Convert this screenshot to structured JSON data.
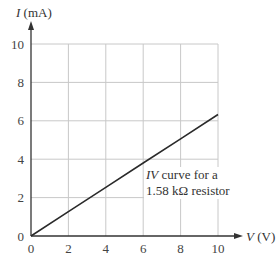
{
  "chart_data": {
    "type": "line",
    "title": "",
    "xlabel": "V (V)",
    "ylabel": "I (mA)",
    "xlabel_var": "V",
    "xlabel_unit": "(V)",
    "ylabel_var": "I",
    "ylabel_unit": "(mA)",
    "xlim": [
      0,
      10
    ],
    "ylim": [
      0,
      10
    ],
    "xticks": [
      0,
      2,
      4,
      6,
      8,
      10
    ],
    "yticks": [
      0,
      2,
      4,
      6,
      8,
      10
    ],
    "grid": true,
    "legend": null,
    "series": [
      {
        "name": "IV curve for a 1.58 kΩ resistor",
        "x": [
          0,
          2,
          4,
          6,
          8,
          10
        ],
        "y": [
          0,
          1.27,
          2.53,
          3.8,
          5.06,
          6.33
        ]
      }
    ],
    "annotations": [
      {
        "text_italic": "IV",
        "text_line1_rest": " curve for a",
        "text_line2": "1.58 kΩ resistor",
        "x": 6.2,
        "y": 3.3
      }
    ]
  },
  "colors": {
    "line": "#2a2a2a",
    "grid": "#c8c8c8",
    "axis": "#333333",
    "text": "#333333"
  }
}
